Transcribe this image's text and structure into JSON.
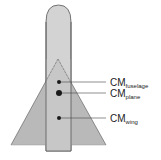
{
  "diagram": {
    "labels": {
      "fuselage": {
        "main": "CM",
        "sub": "fuselage"
      },
      "plane": {
        "main": "CM",
        "sub": "plane"
      },
      "wing": {
        "main": "CM",
        "sub": "wing"
      }
    },
    "colors": {
      "fuselage_fill": "#d3d3d3",
      "wing_fill": "#b9b9b9",
      "outline": "#555555",
      "dot": "#1a1a1a",
      "leader": "#444444"
    }
  }
}
